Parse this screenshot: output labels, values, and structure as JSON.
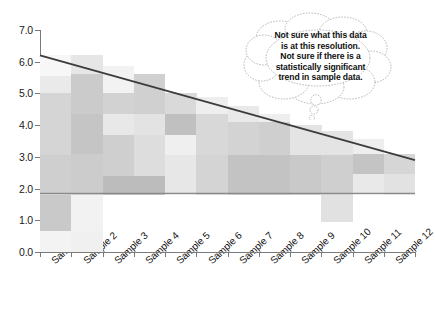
{
  "chart_data": {
    "type": "heatmap",
    "title": "",
    "xlabel": "",
    "ylabel": "",
    "ylim": [
      0.0,
      7.0
    ],
    "grid": false,
    "legend": null,
    "y_ticks": [
      "0.0",
      "1.0",
      "2.0",
      "3.0",
      "4.0",
      "5.0",
      "6.0",
      "7.0"
    ],
    "y_tick_values": [
      0.0,
      1.0,
      2.0,
      3.0,
      4.0,
      5.0,
      6.0,
      7.0
    ],
    "categories": [
      "Sample 1",
      "Sample 2",
      "Sample 3",
      "Sample 4",
      "Sample 5",
      "Sample 6",
      "Sample 7",
      "Sample 8",
      "Sample 9",
      "Sample 10",
      "Sample 11",
      "Sample 12"
    ],
    "cell_fill_note": "greyscale blocks; lighter = lower value, darker = higher value",
    "columns": [
      {
        "category": "Sample 1",
        "blocks": [
          {
            "y0": 0.0,
            "y1": 0.65,
            "shade": "#f3f3f3"
          },
          {
            "y0": 0.65,
            "y1": 1.8,
            "shade": "#c9c9c9"
          },
          {
            "y0": 1.8,
            "y1": 3.05,
            "shade": "#cfcfcf"
          },
          {
            "y0": 3.05,
            "y1": 5.0,
            "shade": "#d5d5d5"
          },
          {
            "y0": 5.0,
            "y1": 5.55,
            "shade": "#eaeaea"
          },
          {
            "y0": 5.55,
            "y1": 6.2,
            "shade": "#f7f7f7"
          }
        ]
      },
      {
        "category": "Sample 2",
        "blocks": [
          {
            "y0": 0.0,
            "y1": 0.65,
            "shade": "#f0f0f0"
          },
          {
            "y0": 0.65,
            "y1": 1.8,
            "shade": "#f2f2f2"
          },
          {
            "y0": 1.8,
            "y1": 3.1,
            "shade": "#cccccc"
          },
          {
            "y0": 3.1,
            "y1": 4.35,
            "shade": "#c5c5c5"
          },
          {
            "y0": 4.35,
            "y1": 5.6,
            "shade": "#cbcbcb"
          },
          {
            "y0": 5.6,
            "y1": 6.2,
            "shade": "#e6e6e6"
          }
        ]
      },
      {
        "category": "Sample 3",
        "blocks": [
          {
            "y0": 1.8,
            "y1": 2.4,
            "shade": "#bcbcbc"
          },
          {
            "y0": 2.4,
            "y1": 3.7,
            "shade": "#cfcfcf"
          },
          {
            "y0": 3.7,
            "y1": 4.35,
            "shade": "#e8e8e8"
          },
          {
            "y0": 4.35,
            "y1": 5.0,
            "shade": "#d2d2d2"
          },
          {
            "y0": 5.0,
            "y1": 5.85,
            "shade": "#f2f2f2"
          }
        ]
      },
      {
        "category": "Sample 4",
        "blocks": [
          {
            "y0": 1.8,
            "y1": 2.4,
            "shade": "#bcbcbc"
          },
          {
            "y0": 2.4,
            "y1": 3.7,
            "shade": "#dddddd"
          },
          {
            "y0": 3.7,
            "y1": 4.35,
            "shade": "#e3e3e3"
          },
          {
            "y0": 4.35,
            "y1": 5.6,
            "shade": "#d0d0d0"
          }
        ]
      },
      {
        "category": "Sample 5",
        "blocks": [
          {
            "y0": 1.8,
            "y1": 3.05,
            "shade": "#e7e7e7"
          },
          {
            "y0": 3.05,
            "y1": 3.7,
            "shade": "#efefef"
          },
          {
            "y0": 3.7,
            "y1": 4.35,
            "shade": "#c0c0c0"
          },
          {
            "y0": 4.35,
            "y1": 5.0,
            "shade": "#d9d9d9"
          }
        ]
      },
      {
        "category": "Sample 6",
        "blocks": [
          {
            "y0": 1.8,
            "y1": 3.05,
            "shade": "#d4d4d4"
          },
          {
            "y0": 3.05,
            "y1": 4.35,
            "shade": "#d8d8d8"
          },
          {
            "y0": 4.35,
            "y1": 4.9,
            "shade": "#eeeeee"
          }
        ]
      },
      {
        "category": "Sample 7",
        "blocks": [
          {
            "y0": 1.8,
            "y1": 3.05,
            "shade": "#c3c3c3"
          },
          {
            "y0": 3.05,
            "y1": 4.1,
            "shade": "#d3d3d3"
          },
          {
            "y0": 4.1,
            "y1": 4.6,
            "shade": "#e9e9e9"
          }
        ]
      },
      {
        "category": "Sample 8",
        "blocks": [
          {
            "y0": 1.8,
            "y1": 3.05,
            "shade": "#c3c3c3"
          },
          {
            "y0": 3.05,
            "y1": 4.1,
            "shade": "#cfcfcf"
          },
          {
            "y0": 4.1,
            "y1": 4.35,
            "shade": "#eeeeee"
          }
        ]
      },
      {
        "category": "Sample 9",
        "blocks": [
          {
            "y0": 1.8,
            "y1": 3.05,
            "shade": "#c9c9c9"
          },
          {
            "y0": 3.05,
            "y1": 4.0,
            "shade": "#e4e4e4"
          }
        ]
      },
      {
        "category": "Sample 10",
        "blocks": [
          {
            "y0": 0.95,
            "y1": 1.8,
            "shade": "#e1e1e1"
          },
          {
            "y0": 1.8,
            "y1": 3.05,
            "shade": "#cfcfcf"
          },
          {
            "y0": 3.05,
            "y1": 3.8,
            "shade": "#e4e4e4"
          }
        ]
      },
      {
        "category": "Sample 11",
        "blocks": [
          {
            "y0": 1.8,
            "y1": 2.45,
            "shade": "#e9e9e9"
          },
          {
            "y0": 2.45,
            "y1": 3.1,
            "shade": "#c4c4c4"
          },
          {
            "y0": 3.1,
            "y1": 3.55,
            "shade": "#eeeeee"
          }
        ]
      },
      {
        "category": "Sample 12",
        "blocks": [
          {
            "y0": 1.8,
            "y1": 2.45,
            "shade": "#e2e2e2"
          },
          {
            "y0": 2.45,
            "y1": 3.1,
            "shade": "#d6d6d6"
          }
        ]
      }
    ],
    "trend_line": {
      "name": "declining trend line",
      "color": "#3c3c3c",
      "x_start_category": "Sample 1",
      "x_end_category": "Sample 12",
      "y_start": 6.2,
      "y_end": 2.9
    },
    "reference_line": {
      "name": "horizontal reference line",
      "color": "#8a8a8a",
      "y": 1.85
    }
  },
  "annotation": {
    "type": "thought-bubble",
    "lines": [
      "Not sure what this data",
      "is at this resolution.",
      "Not sure if there is a",
      "statistically significant",
      "trend in sample data."
    ]
  }
}
